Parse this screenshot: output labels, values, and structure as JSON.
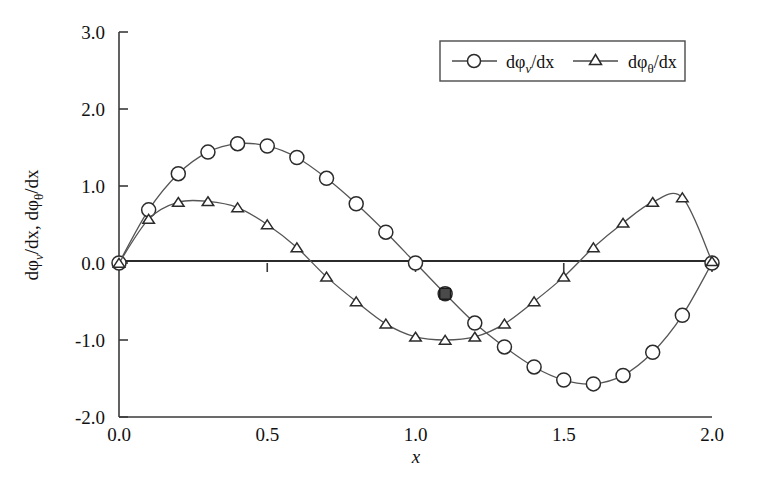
{
  "chart_data": {
    "type": "line",
    "title": "",
    "xlabel": "x",
    "ylabel": "dφᵥ/dx, dφθ/dx",
    "xlim": [
      0.0,
      2.0
    ],
    "ylim": [
      -2.0,
      3.0
    ],
    "xticks": [
      "0.0",
      "0.5",
      "1.0",
      "1.5",
      "2.0"
    ],
    "xtick_values": [
      0.0,
      0.5,
      1.0,
      1.5,
      2.0
    ],
    "yticks": [
      "3.0",
      "2.0",
      "1.0",
      "0.0",
      "-1.0",
      "-2.0"
    ],
    "ytick_values": [
      3.0,
      2.0,
      1.0,
      0.0,
      -1.0,
      -2.0
    ],
    "grid": false,
    "legend_position": "top-right",
    "x": [
      0.0,
      0.1,
      0.2,
      0.3,
      0.4,
      0.5,
      0.6,
      0.7,
      0.8,
      0.9,
      1.0,
      1.1,
      1.2,
      1.3,
      1.4,
      1.5,
      1.6,
      1.7,
      1.8,
      1.9,
      2.0
    ],
    "series": [
      {
        "name": "dφᵥ/dx",
        "marker": "circle",
        "values": [
          0.0,
          0.69,
          1.16,
          1.44,
          1.55,
          1.52,
          1.37,
          1.1,
          0.77,
          0.4,
          0.0,
          -0.4,
          -0.78,
          -1.09,
          -1.35,
          -1.52,
          -1.57,
          -1.46,
          -1.16,
          -0.68,
          0.0
        ]
      },
      {
        "name": "dφθ/dx",
        "marker": "triangle",
        "values": [
          0.0,
          0.57,
          0.79,
          0.8,
          0.72,
          0.5,
          0.2,
          -0.18,
          -0.5,
          -0.79,
          -0.96,
          -1.0,
          -0.96,
          -0.79,
          -0.5,
          -0.18,
          0.2,
          0.52,
          0.79,
          0.85,
          0.02
        ]
      }
    ]
  },
  "legend": {
    "entries": [
      {
        "label_prefix": "dφ",
        "label_sub": "v",
        "label_suffix": "/dx",
        "marker": "circle"
      },
      {
        "label_prefix": "dφ",
        "label_sub": "θ",
        "label_suffix": "/dx",
        "marker": "triangle"
      }
    ]
  },
  "axis": {
    "x_title": "x",
    "y_title_part1": "dφ",
    "y_title_sub1": "v",
    "y_title_mid": "/dx, dφ",
    "y_title_sub2": "θ",
    "y_title_end": "/dx"
  },
  "colors": {
    "curve": "#555555",
    "axis": "#3a3a3a",
    "marker_fill": "#ffffff",
    "marker_stroke": "#2b2b2b",
    "background": "#ffffff"
  }
}
